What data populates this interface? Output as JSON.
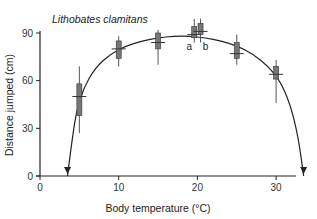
{
  "chart_data": {
    "type": "box",
    "title": "Lithobates clamitans",
    "xlabel": "Body temperature (°C)",
    "ylabel": "Distance jumped (cm)",
    "xlim": [
      0,
      35
    ],
    "ylim": [
      0,
      90
    ],
    "xticks": [
      0,
      10,
      20,
      30
    ],
    "yticks": [
      0,
      30,
      60,
      90
    ],
    "grid": false,
    "legend": null,
    "values_are_estimates": true,
    "estimate_note": "Values read off the plot by eye using axis calibration (0 cm at y≈176, 90 cm at y≈33; 0°C at x≈40, ~7.87 px/°C). Fine-detail zooms on individual boxes were too blurry to refine, so quartiles/whiskers/medians may be off by a few cm.",
    "boxes": [
      {
        "temp": 5,
        "label": "",
        "median": 50,
        "q1": 38,
        "q3": 58,
        "whisker_low": 27,
        "whisker_high": 69
      },
      {
        "temp": 10,
        "label": "",
        "median": 80,
        "q1": 74,
        "q3": 85,
        "whisker_low": 69,
        "whisker_high": 88
      },
      {
        "temp": 15,
        "label": "",
        "median": 84,
        "q1": 80,
        "q3": 90,
        "whisker_low": 70,
        "whisker_high": 92
      },
      {
        "temp": 19.6,
        "label": "a",
        "median": 89,
        "q1": 87,
        "q3": 94,
        "whisker_low": 84,
        "whisker_high": 99
      },
      {
        "temp": 20.4,
        "label": "b",
        "median": 91,
        "q1": 89,
        "q3": 96,
        "whisker_low": 84,
        "whisker_high": 99
      },
      {
        "temp": 25,
        "label": "",
        "median": 77,
        "q1": 74,
        "q3": 84,
        "whisker_low": 70,
        "whisker_high": 89
      },
      {
        "temp": 30,
        "label": "",
        "median": 64,
        "q1": 61,
        "q3": 69,
        "whisker_low": 46,
        "whisker_high": 73
      }
    ],
    "fit_curve": {
      "description": "Eyeballed approximation of the thermal performance curve; not a fitted function",
      "shape_estimated": true,
      "arrow_ends": [
        3.5,
        33.5
      ],
      "points": [
        [
          3.5,
          0
        ],
        [
          4.0,
          20
        ],
        [
          4.6,
          40
        ],
        [
          5.5,
          55
        ],
        [
          7,
          68
        ],
        [
          9,
          77
        ],
        [
          11,
          82
        ],
        [
          13,
          85
        ],
        [
          15,
          87
        ],
        [
          17,
          88
        ],
        [
          19,
          88
        ],
        [
          21,
          87
        ],
        [
          23,
          85
        ],
        [
          25,
          82
        ],
        [
          27,
          77
        ],
        [
          29,
          69
        ],
        [
          30.5,
          60
        ],
        [
          31.8,
          45
        ],
        [
          32.8,
          25
        ],
        [
          33.5,
          0
        ]
      ]
    },
    "annotations": [
      "a",
      "b"
    ]
  }
}
